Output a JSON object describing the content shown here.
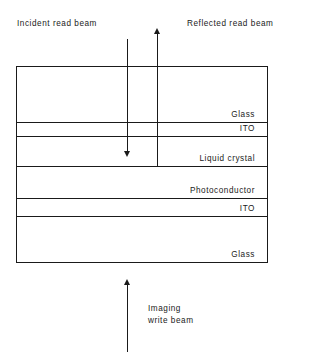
{
  "diagram": {
    "header": {
      "incident_label": "Incident read beam",
      "reflected_label": "Reflected read beam"
    },
    "bottom": {
      "write_label": "Imaging\nwrite beam"
    },
    "layers": [
      {
        "id": "glass-top",
        "name": "Glass"
      },
      {
        "id": "ito-top",
        "name": "ITO"
      },
      {
        "id": "liquid-crystal",
        "name": "Liquid crystal"
      },
      {
        "id": "photoconductor",
        "name": "Photoconductor"
      },
      {
        "id": "ito-bottom",
        "name": "ITO"
      },
      {
        "id": "glass-bottom",
        "name": "Glass"
      }
    ],
    "beams": [
      {
        "id": "incident-read-beam",
        "direction": "down"
      },
      {
        "id": "reflected-read-beam",
        "direction": "up"
      },
      {
        "id": "imaging-write-beam",
        "direction": "up"
      }
    ],
    "colors": {
      "stroke": "#1a1a1a",
      "background": "#ffffff"
    }
  }
}
